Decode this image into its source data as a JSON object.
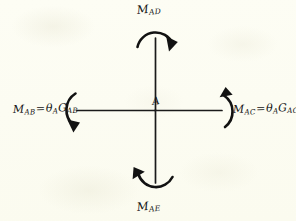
{
  "diagram": {
    "background_color": "#fdfdf4",
    "ink_color": "#141414",
    "joint": {
      "name": "joint-A",
      "label": "A",
      "x": 155,
      "y": 110
    },
    "members": [
      {
        "name": "member-A-to-left",
        "label": "AB",
        "from": [
          155,
          110
        ],
        "to": [
          77,
          110
        ]
      },
      {
        "name": "member-A-to-right",
        "label": "AC",
        "from": [
          155,
          110
        ],
        "to": [
          222,
          110
        ]
      },
      {
        "name": "member-A-up",
        "label": "AD",
        "from": [
          155,
          110
        ],
        "to": [
          155,
          38
        ]
      },
      {
        "name": "member-A-down",
        "label": "AE",
        "from": [
          155,
          110
        ],
        "to": [
          155,
          183
        ]
      }
    ],
    "moments": [
      {
        "name": "moment-AD",
        "symbol": "M",
        "subscript": "AD",
        "text": "M_AD",
        "position": "top",
        "sense": "clockwise",
        "arc_opening": "down",
        "arrowhead_end": "right"
      },
      {
        "name": "moment-AE",
        "symbol": "M",
        "subscript": "AE",
        "text": "M_AE",
        "position": "bottom",
        "sense": "clockwise",
        "arc_opening": "up",
        "arrowhead_end": "left"
      },
      {
        "name": "moment-AB",
        "symbol": "M",
        "subscript": "AB",
        "text": "M_AB = θ_A G_AB",
        "equals": "=",
        "theta": "θ",
        "theta_subscript": "A",
        "stiffness": "G",
        "stiffness_subscript": "AB",
        "position": "left",
        "sense": "clockwise",
        "arc_opening": "right",
        "arrowhead_end": "bottom"
      },
      {
        "name": "moment-AC",
        "symbol": "M",
        "subscript": "AC",
        "text": "M_AC = θ_A G_AC",
        "equals": "=",
        "theta": "θ",
        "theta_subscript": "A",
        "stiffness": "G",
        "stiffness_subscript": "AC",
        "position": "right",
        "sense": "clockwise",
        "arc_opening": "left",
        "arrowhead_end": "top"
      }
    ]
  }
}
